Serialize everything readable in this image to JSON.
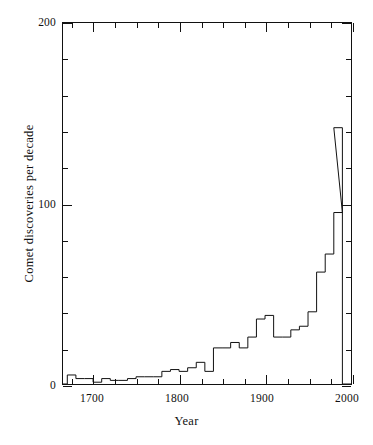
{
  "chart_data": {
    "type": "bar",
    "title": "",
    "subtitle": "",
    "xlabel": "Year",
    "ylabel": "Comet discoveries per decade",
    "xlim": [
      1665,
      2000
    ],
    "ylim": [
      0,
      200
    ],
    "xticks": [
      1700,
      1800,
      1900,
      2000
    ],
    "xtick_labels": [
      "1700",
      "1800",
      "1900",
      "2000"
    ],
    "xminor_step": 25,
    "yticks": [
      0,
      100,
      200
    ],
    "ytick_labels": [
      "0",
      "100",
      "200"
    ],
    "yminor_step": 20,
    "grid": false,
    "legend": null,
    "bin_width": 10,
    "line_color": "#111111",
    "background_color": "#ffffff",
    "categories": [
      "1670",
      "1680",
      "1690",
      "1700",
      "1710",
      "1720",
      "1730",
      "1740",
      "1750",
      "1760",
      "1770",
      "1780",
      "1790",
      "1800",
      "1810",
      "1820",
      "1830",
      "1840",
      "1850",
      "1860",
      "1870",
      "1880",
      "1890",
      "1900",
      "1910",
      "1920",
      "1930",
      "1940",
      "1950",
      "1960",
      "1970",
      "1980"
    ],
    "values": [
      5,
      3,
      3,
      1,
      3,
      2,
      2,
      3,
      4,
      4,
      4,
      7,
      8,
      7,
      9,
      12,
      7,
      20,
      20,
      23,
      20,
      26,
      36,
      38,
      26,
      26,
      30,
      32,
      40,
      62,
      72,
      95
    ],
    "series": [
      {
        "name": "Comet discoveries per decade",
        "x": [
          1670,
          1680,
          1690,
          1700,
          1710,
          1720,
          1730,
          1740,
          1750,
          1760,
          1770,
          1780,
          1790,
          1800,
          1810,
          1820,
          1830,
          1840,
          1850,
          1860,
          1870,
          1880,
          1890,
          1900,
          1910,
          1920,
          1930,
          1940,
          1950,
          1960,
          1970,
          1980
        ],
        "values": [
          5,
          3,
          3,
          1,
          3,
          2,
          2,
          3,
          4,
          4,
          4,
          7,
          8,
          7,
          9,
          12,
          7,
          20,
          20,
          23,
          20,
          26,
          36,
          38,
          26,
          26,
          30,
          32,
          40,
          62,
          72,
          95
        ]
      }
    ],
    "peak": {
      "decade": "1970",
      "value": 142
    },
    "annotations": []
  },
  "axes": {
    "y_top_label": "200",
    "y_mid_label": "100",
    "y_zero_label": "0",
    "x_first_label": "1700",
    "x_last_label": "2000"
  }
}
